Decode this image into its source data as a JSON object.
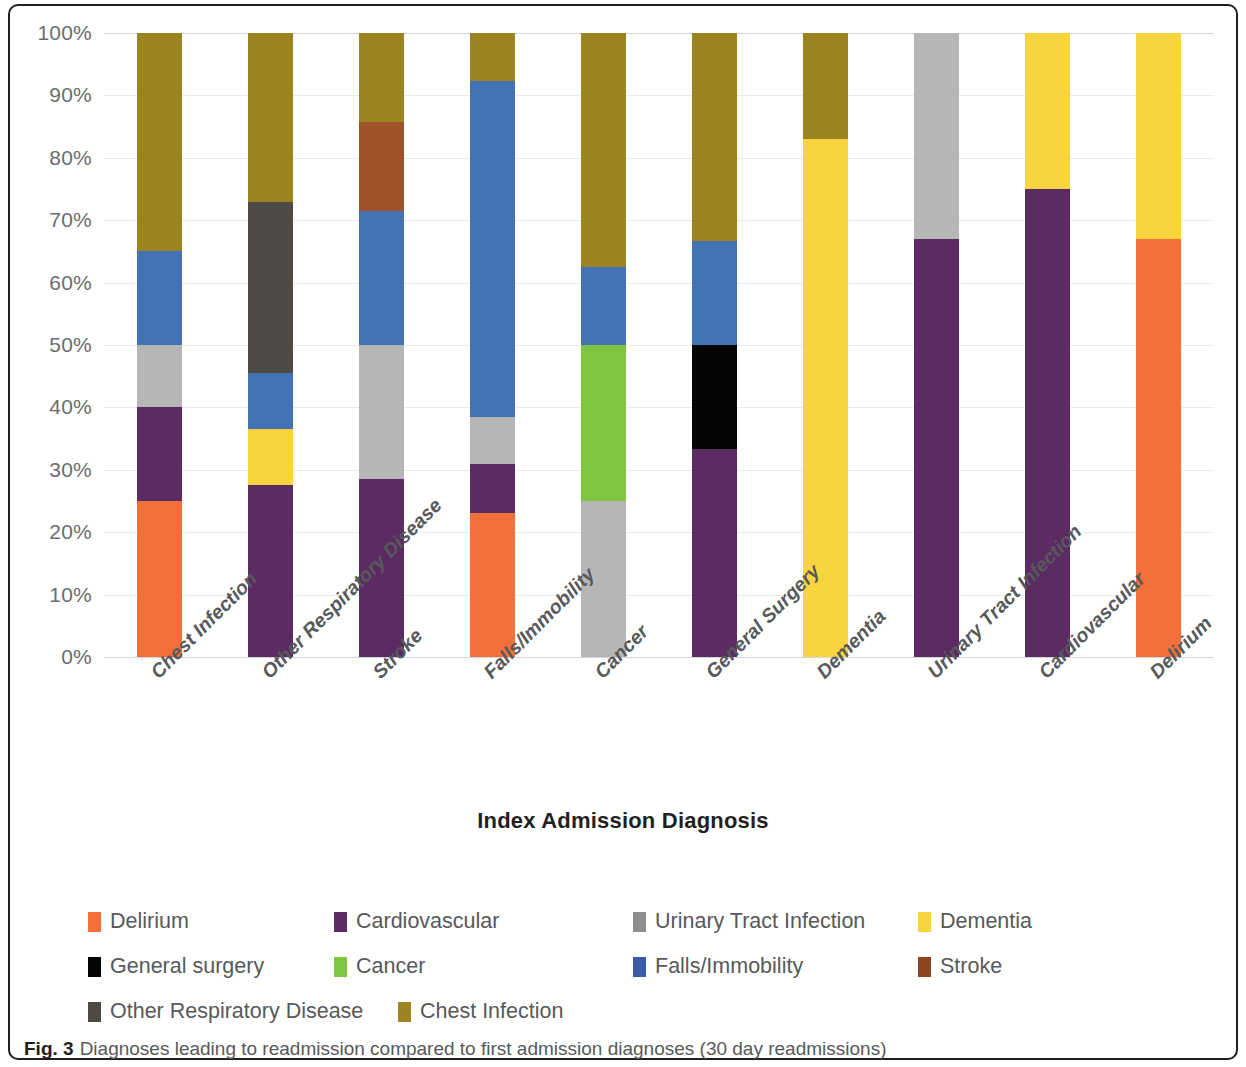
{
  "figure": {
    "caption_label": "Fig. 3",
    "caption_text": "Diagnoses leading to readmission compared to first admission diagnoses (30 day readmissions)"
  },
  "chart_data": {
    "type": "bar",
    "stacked": true,
    "normalized": "percent",
    "title": "",
    "xlabel": "Index Admission Diagnosis",
    "ylabel": "",
    "ylim": [
      0,
      100
    ],
    "ytick_labels": [
      "0%",
      "10%",
      "20%",
      "30%",
      "40%",
      "50%",
      "60%",
      "70%",
      "80%",
      "90%",
      "100%"
    ],
    "ytick_values": [
      0,
      10,
      20,
      30,
      40,
      50,
      60,
      70,
      80,
      90,
      100
    ],
    "grid": true,
    "legend_position": "bottom",
    "categories": [
      "Chest Infection",
      "Other Respiratory Disease",
      "Stroke",
      "Falls/Immobility",
      "Cancer",
      "General Surgery",
      "Dementia",
      "Urinary Tract Infection",
      "Cardiovascular",
      "Delirium"
    ],
    "series": [
      {
        "name": "Delirium",
        "color": "#f4703a",
        "values": [
          25,
          0,
          0,
          23,
          0,
          0,
          0,
          0,
          0,
          67
        ]
      },
      {
        "name": "Cardiovascular",
        "color": "#5c2b63",
        "values": [
          15,
          27.5,
          28.6,
          8,
          0,
          33.3,
          0,
          67,
          75,
          0
        ]
      },
      {
        "name": "Urinary Tract Infection",
        "color": "#b6b6b6",
        "values": [
          10,
          0,
          21.4,
          7.5,
          25,
          0,
          0,
          33,
          0,
          0
        ]
      },
      {
        "name": "Dementia",
        "color": "#f8d53f",
        "values": [
          0,
          9,
          0,
          0,
          0,
          0,
          83,
          0,
          25,
          33
        ]
      },
      {
        "name": "General surgery",
        "color": "#050505",
        "values": [
          0,
          0,
          0,
          0,
          0,
          16.7,
          0,
          0,
          0,
          0
        ]
      },
      {
        "name": "Cancer",
        "color": "#7ec63f",
        "values": [
          0,
          0,
          0,
          0,
          25,
          0,
          0,
          0,
          0,
          0
        ]
      },
      {
        "name": "Falls/Immobility",
        "color": "#4372b5",
        "values": [
          15,
          9,
          21.4,
          53.8,
          12.5,
          16.7,
          0,
          0,
          0,
          0
        ]
      },
      {
        "name": "Stroke",
        "color": "#a0522a",
        "values": [
          0,
          0,
          14.3,
          0,
          0,
          0,
          0,
          0,
          0,
          0
        ]
      },
      {
        "name": "Other Respiratory Disease",
        "color": "#4d4a45",
        "values": [
          0,
          27.5,
          0,
          0,
          0,
          0,
          0,
          0,
          0,
          0
        ]
      },
      {
        "name": "Chest Infection",
        "color": "#9b8420",
        "values": [
          35,
          27,
          14.3,
          7.7,
          37.5,
          33.3,
          17,
          0,
          0,
          0
        ]
      }
    ]
  },
  "legend": {
    "rows": [
      [
        {
          "label": "Delirium",
          "color": "#f4703a"
        },
        {
          "label": "Cardiovascular",
          "color": "#5c2b63"
        },
        {
          "label": "Urinary Tract Infection",
          "color": "#8e8e8e"
        },
        {
          "label": "Dementia",
          "color": "#f8d53f"
        }
      ],
      [
        {
          "label": "General surgery",
          "color": "#050505"
        },
        {
          "label": "Cancer",
          "color": "#7ec63f"
        },
        {
          "label": "Falls/Immobility",
          "color": "#3a5ca8"
        },
        {
          "label": "Stroke",
          "color": "#8d4520"
        }
      ],
      [
        {
          "label": "Other Respiratory Disease",
          "color": "#4d4a45"
        },
        {
          "label": "Chest Infection",
          "color": "#9b8420"
        }
      ]
    ]
  }
}
